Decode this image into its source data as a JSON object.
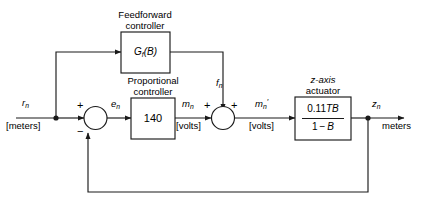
{
  "diagram": {
    "type": "block-diagram",
    "colors": {
      "line": "#1a1a1a",
      "background": "#ffffff",
      "text": "#000000"
    },
    "blocks": [
      {
        "id": "feedforward-controller",
        "caption_line1": "Feedforward",
        "caption_line2": "controller",
        "body": "G",
        "body_sub": "f",
        "body_tail": "(B)"
      },
      {
        "id": "proportional-controller",
        "caption_line1": "Proportional",
        "caption_line2": "controller",
        "gain": "140"
      },
      {
        "id": "z-axis-actuator",
        "caption_line1": "z-axis",
        "caption_line2": "actuator",
        "numerator_value": "0.11",
        "numerator_vars": "TB",
        "denominator_left": "1",
        "denominator_op": "−",
        "denominator_right": "B"
      }
    ],
    "summing_junctions": [
      {
        "id": "error-summer",
        "sign_top": "+",
        "sign_bottom": "−"
      },
      {
        "id": "feedforward-summer",
        "sign_left": "+",
        "sign_right": "+"
      }
    ],
    "signals": [
      {
        "id": "reference-input",
        "symbol": "r",
        "subscript": "n",
        "unit": "[meters]"
      },
      {
        "id": "error-signal",
        "symbol": "e",
        "subscript": "n",
        "unit": ""
      },
      {
        "id": "controller-output",
        "symbol": "m",
        "subscript": "n",
        "unit": "[volts]"
      },
      {
        "id": "feedforward-signal",
        "symbol": "f",
        "subscript": "n",
        "unit": ""
      },
      {
        "id": "actuator-input",
        "symbol": "m",
        "subscript": "n",
        "prime": "′",
        "unit": "[volts]"
      },
      {
        "id": "output-signal",
        "symbol": "z",
        "subscript": "n",
        "unit": "meters"
      }
    ]
  }
}
